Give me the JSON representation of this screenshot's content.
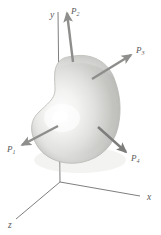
{
  "figure": {
    "kind": "3d-free-body-diagram",
    "background_color": "#ffffff",
    "axes": {
      "origin_label": "",
      "line_color": "#6b6b6b",
      "items": [
        {
          "id": "x",
          "label": "x",
          "label_x": 147,
          "label_y": 200,
          "x1": 60,
          "y1": 182,
          "x2": 140,
          "y2": 196
        },
        {
          "id": "y",
          "label": "y",
          "label_x": 50,
          "label_y": 18,
          "x1": 60,
          "y1": 182,
          "x2": 58,
          "y2": 12
        },
        {
          "id": "z",
          "label": "z",
          "label_x": 8,
          "label_y": 228,
          "x1": 60,
          "y1": 182,
          "x2": 16,
          "y2": 219
        }
      ]
    },
    "body": {
      "name": "irregular-rigid-body",
      "fill_light": "#fcfcfc",
      "fill_mid": "#d6d6d4",
      "fill_dark": "#a9a9a6",
      "outline_color": "#b4b4b0",
      "highlight_x": 62,
      "highlight_y": 118
    },
    "forces": {
      "arrow_color": "#8e8e8c",
      "arrow_dark": "#777775",
      "items": [
        {
          "id": "P1",
          "base": "P",
          "sub": "1",
          "label_x": 7,
          "label_y": 152,
          "x1": 58,
          "y1": 126,
          "x2": 22,
          "y2": 145
        },
        {
          "id": "P2",
          "base": "P",
          "sub": "2",
          "label_x": 71,
          "label_y": 14,
          "x1": 73,
          "y1": 62,
          "x2": 67,
          "y2": 13
        },
        {
          "id": "P3",
          "base": "P",
          "sub": "3",
          "label_x": 136,
          "label_y": 53,
          "x1": 92,
          "y1": 79,
          "x2": 131,
          "y2": 55
        },
        {
          "id": "P4",
          "base": "P",
          "sub": "4",
          "label_x": 131,
          "label_y": 161,
          "x1": 98,
          "y1": 127,
          "x2": 126,
          "y2": 152
        }
      ]
    }
  }
}
